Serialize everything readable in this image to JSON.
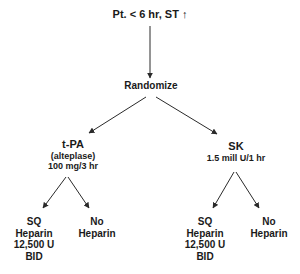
{
  "diagram": {
    "type": "flowchart",
    "root": {
      "label": "Pt. < 6 hr, ST ↑"
    },
    "randomize": {
      "label": "Randomize"
    },
    "arms": [
      {
        "name": "t-PA",
        "detail_line1": "(alteplase)",
        "detail_line2": "100 mg/3 hr",
        "branches": [
          {
            "line1": "SQ",
            "line2": "Heparin",
            "line3": "12,500 U",
            "line4": "BID"
          },
          {
            "line1": "No",
            "line2": "Heparin"
          }
        ]
      },
      {
        "name": "SK",
        "detail_line1": "1.5 mill U/1 hr",
        "branches": [
          {
            "line1": "SQ",
            "line2": "Heparin",
            "line3": "12,500 U",
            "line4": "BID"
          },
          {
            "line1": "No",
            "line2": "Heparin"
          }
        ]
      }
    ],
    "colors": {
      "line": "#2a2a2a",
      "text": "#1a1a1a",
      "background": "#ffffff"
    }
  }
}
